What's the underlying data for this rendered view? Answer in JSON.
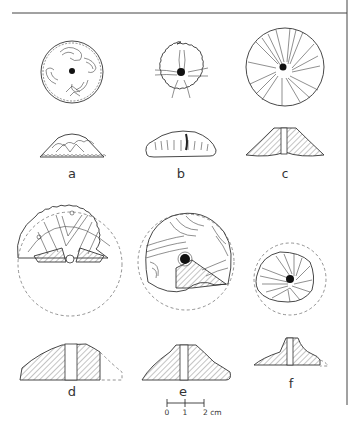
{
  "figure": {
    "type": "archaeological-plate",
    "items": [
      {
        "id": "a",
        "label": "a",
        "complete": true,
        "decoration": "curvilinear scroll motifs, notched rim"
      },
      {
        "id": "b",
        "label": "b",
        "complete": true,
        "decoration": "cross-shaped incised lines, notched rim"
      },
      {
        "id": "c",
        "label": "c",
        "complete": true,
        "decoration": "radiating spiral lines"
      },
      {
        "id": "d",
        "label": "d",
        "complete": false,
        "decoration": "chevron bands, notched rim (fragment, reconstructed)"
      },
      {
        "id": "e",
        "label": "e",
        "complete": false,
        "decoration": "concentric arcs (fragment, reconstructed)"
      },
      {
        "id": "f",
        "label": "f",
        "complete": false,
        "decoration": "swirling hatched lines (fragment, reconstructed)"
      }
    ],
    "scale_bar": {
      "ticks": [
        "0",
        "1",
        "2 cm"
      ],
      "unit": "cm"
    }
  }
}
